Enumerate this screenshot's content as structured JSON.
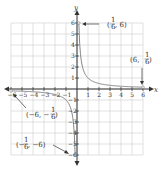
{
  "chart_data": {
    "type": "line",
    "title": "",
    "xlabel": "x",
    "ylabel": "y",
    "xlim": [
      -6,
      6
    ],
    "ylim": [
      -6,
      6
    ],
    "grid": true,
    "x_ticks": [
      "-6",
      "-5",
      "-4",
      "-3",
      "-2",
      "-1",
      "1",
      "2",
      "3",
      "4",
      "5",
      "6"
    ],
    "y_ticks": [
      "6",
      "5",
      "4",
      "3",
      "2",
      "1",
      "-1",
      "-2",
      "-3",
      "-4",
      "-5",
      "-6"
    ],
    "series": [
      {
        "name": "y = 1/x (x > 0)",
        "x": [
          0.1667,
          0.25,
          0.5,
          1,
          2,
          3,
          4,
          5,
          6
        ],
        "y": [
          6,
          4,
          2,
          1,
          0.5,
          0.333,
          0.25,
          0.2,
          0.1667
        ]
      },
      {
        "name": "y = 1/x (x < 0)",
        "x": [
          -6,
          -5,
          -4,
          -3,
          -2,
          -1,
          -0.5,
          -0.25,
          -0.1667
        ],
        "y": [
          -0.1667,
          -0.2,
          -0.25,
          -0.333,
          -0.5,
          -1,
          -2,
          -4,
          -6
        ]
      }
    ],
    "annotations": [
      {
        "text": "(1/6, 6)",
        "point": [
          0.1667,
          6
        ]
      },
      {
        "text": "(6, 1/6)",
        "point": [
          6,
          0.1667
        ]
      },
      {
        "text": "(-6, -1/6)",
        "point": [
          -6,
          -0.1667
        ]
      },
      {
        "text": "(-1/6, -6)",
        "point": [
          -0.1667,
          -6
        ]
      }
    ]
  },
  "labels": {
    "x_axis": "x",
    "y_axis": "y",
    "ann1_a": "(",
    "ann1_num": "1",
    "ann1_den": "6",
    "ann1_b": ", 6)",
    "ann2_a": "(6, ",
    "ann2_num": "1",
    "ann2_den": "6",
    "ann2_b": ")",
    "ann3_a": "(−6, −",
    "ann3_num": "1",
    "ann3_den": "6",
    "ann3_b": ")",
    "ann4_a": "(−",
    "ann4_num": "1",
    "ann4_den": "6",
    "ann4_b": ", −6)"
  }
}
